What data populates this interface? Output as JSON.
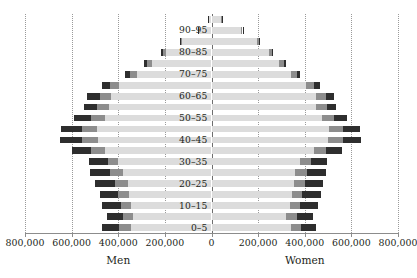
{
  "chart_data": {
    "type": "bar",
    "subtype": "population-pyramid",
    "title": "",
    "xlabel": "",
    "ylabel": "",
    "grid": true,
    "legend": "none",
    "xlim": [
      -800000,
      800000
    ],
    "xtick_values": [
      -800000,
      -600000,
      -400000,
      -200000,
      0,
      200000,
      400000,
      600000,
      800000
    ],
    "xtick_labels": [
      "800,000",
      "600,000",
      "400,000",
      "200,000",
      "0",
      "200,000",
      "400,000",
      "600,000",
      "800,000"
    ],
    "side_labels": {
      "left": "Men",
      "right": "Women"
    },
    "categories": [
      "0–5",
      "5–10",
      "10–15",
      "15–20",
      "20–25",
      "25–30",
      "30–35",
      "35–40",
      "40–45",
      "45–50",
      "50–55",
      "55–60",
      "60–65",
      "65–70",
      "70–75",
      "75–80",
      "80–85",
      "85–90",
      "90–95",
      "95+"
    ],
    "visible_category_labels": [
      "0–5",
      "10–15",
      "20–25",
      "30–35",
      "40–45",
      "50–55",
      "60–65",
      "70–75",
      "80–85",
      "90–95"
    ],
    "stack_order": [
      "light",
      "medium",
      "dark"
    ],
    "segment_colors": {
      "light": "#dcdcdc",
      "medium": "#8d8d8d",
      "dark": "#2e2e2e"
    },
    "series": [
      {
        "name": "Men",
        "side": "left",
        "totals": [
          470000,
          450000,
          470000,
          480000,
          500000,
          520000,
          525000,
          600000,
          650000,
          645000,
          590000,
          545000,
          535000,
          470000,
          370000,
          290000,
          215000,
          135000,
          60000,
          15000
        ],
        "segments": {
          "light": [
            345000,
            335000,
            345000,
            355000,
            360000,
            380000,
            400000,
            455000,
            485000,
            490000,
            455000,
            440000,
            430000,
            395000,
            320000,
            255000,
            195000,
            125000,
            55000,
            13000
          ],
          "medium": [
            50000,
            45000,
            45000,
            45000,
            55000,
            55000,
            45000,
            60000,
            70000,
            65000,
            60000,
            50000,
            50000,
            40000,
            30000,
            20000,
            12000,
            7000,
            3000,
            1500
          ],
          "dark": [
            75000,
            70000,
            80000,
            80000,
            85000,
            85000,
            80000,
            85000,
            95000,
            90000,
            75000,
            55000,
            55000,
            35000,
            20000,
            15000,
            8000,
            3000,
            2000,
            500
          ]
        }
      },
      {
        "name": "Women",
        "side": "right",
        "totals": [
          450000,
          435000,
          455000,
          470000,
          480000,
          490000,
          495000,
          560000,
          640000,
          635000,
          580000,
          535000,
          525000,
          465000,
          380000,
          320000,
          265000,
          205000,
          135000,
          45000
        ],
        "segments": {
          "light": [
            340000,
            320000,
            335000,
            345000,
            355000,
            360000,
            380000,
            440000,
            500000,
            505000,
            475000,
            450000,
            450000,
            405000,
            340000,
            290000,
            245000,
            195000,
            128000,
            42000
          ],
          "medium": [
            45000,
            45000,
            45000,
            45000,
            45000,
            50000,
            45000,
            50000,
            65000,
            60000,
            50000,
            45000,
            40000,
            35000,
            25000,
            20000,
            13000,
            7000,
            5000,
            2000
          ],
          "dark": [
            65000,
            70000,
            75000,
            80000,
            80000,
            80000,
            70000,
            70000,
            75000,
            70000,
            55000,
            40000,
            35000,
            25000,
            15000,
            10000,
            7000,
            3000,
            2000,
            1000
          ]
        }
      }
    ]
  }
}
